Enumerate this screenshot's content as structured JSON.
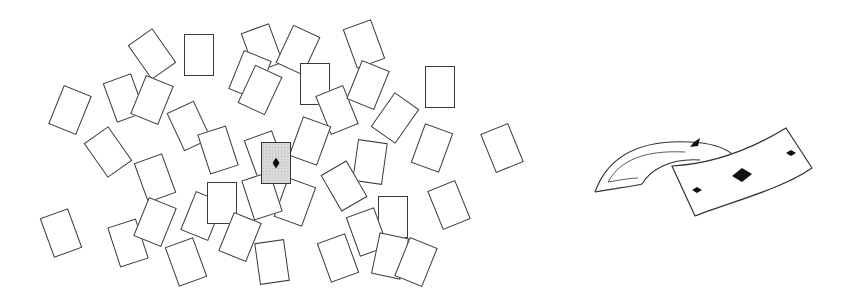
{
  "figure": {
    "colors": {
      "stroke": "#3a3a3a",
      "highlight_fill": "#d9d9d9",
      "pip": "#111111",
      "background": "#ffffff"
    },
    "highlighted_card": {
      "x": 276,
      "y": 163,
      "rotation": 0,
      "suit": "diamond"
    },
    "scattered_cards": [
      {
        "x": 70,
        "y": 110,
        "r": 22
      },
      {
        "x": 152,
        "y": 54,
        "r": -35
      },
      {
        "x": 199,
        "y": 55,
        "r": 0
      },
      {
        "x": 124,
        "y": 98,
        "r": -20
      },
      {
        "x": 152,
        "y": 100,
        "r": 22
      },
      {
        "x": 189,
        "y": 126,
        "r": -25
      },
      {
        "x": 218,
        "y": 150,
        "r": -18
      },
      {
        "x": 108,
        "y": 152,
        "r": -35
      },
      {
        "x": 155,
        "y": 178,
        "r": -20
      },
      {
        "x": 61,
        "y": 233,
        "r": -20
      },
      {
        "x": 128,
        "y": 243,
        "r": -18
      },
      {
        "x": 155,
        "y": 222,
        "r": 22
      },
      {
        "x": 202,
        "y": 216,
        "r": 22
      },
      {
        "x": 186,
        "y": 262,
        "r": -20
      },
      {
        "x": 222,
        "y": 203,
        "r": 0
      },
      {
        "x": 240,
        "y": 237,
        "r": 22
      },
      {
        "x": 272,
        "y": 262,
        "r": -8
      },
      {
        "x": 262,
        "y": 48,
        "r": -20
      },
      {
        "x": 298,
        "y": 50,
        "r": 25
      },
      {
        "x": 250,
        "y": 75,
        "r": 22
      },
      {
        "x": 260,
        "y": 90,
        "r": 25
      },
      {
        "x": 315,
        "y": 84,
        "r": 0
      },
      {
        "x": 337,
        "y": 110,
        "r": -22
      },
      {
        "x": 364,
        "y": 44,
        "r": -20
      },
      {
        "x": 368,
        "y": 85,
        "r": 22
      },
      {
        "x": 395,
        "y": 118,
        "r": 35
      },
      {
        "x": 440,
        "y": 87,
        "r": 0
      },
      {
        "x": 265,
        "y": 155,
        "r": -20
      },
      {
        "x": 310,
        "y": 141,
        "r": 20
      },
      {
        "x": 370,
        "y": 162,
        "r": 8
      },
      {
        "x": 432,
        "y": 148,
        "r": 20
      },
      {
        "x": 502,
        "y": 148,
        "r": -22
      },
      {
        "x": 295,
        "y": 202,
        "r": 20
      },
      {
        "x": 262,
        "y": 196,
        "r": -18
      },
      {
        "x": 344,
        "y": 186,
        "r": -30
      },
      {
        "x": 449,
        "y": 205,
        "r": -22
      },
      {
        "x": 393,
        "y": 217,
        "r": 0
      },
      {
        "x": 367,
        "y": 232,
        "r": -20
      },
      {
        "x": 338,
        "y": 258,
        "r": -20
      },
      {
        "x": 390,
        "y": 256,
        "r": 12
      },
      {
        "x": 416,
        "y": 262,
        "r": 22
      }
    ],
    "curling_card": {
      "x": 590,
      "y": 120,
      "width": 240,
      "height": 110,
      "suit": "diamond",
      "pips_visible": 3
    }
  }
}
